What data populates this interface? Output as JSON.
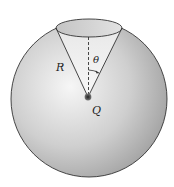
{
  "diagram": {
    "labels": {
      "radius": "R",
      "angle": "θ",
      "charge": "Q"
    },
    "colors": {
      "sphere_light": "#f4f4f4",
      "sphere_dark": "#9a9a9a",
      "outline": "#333333",
      "charge": "#333333"
    }
  }
}
